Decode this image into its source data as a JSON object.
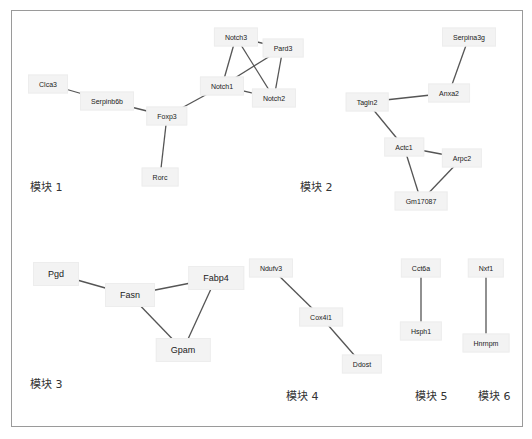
{
  "diagram": {
    "type": "gene-interaction-network",
    "modules": [
      {
        "id": 1,
        "label": "模块 1",
        "pos": [
          30,
          185
        ],
        "nodes": [
          {
            "name": "Clca3",
            "x": 48,
            "y": 84
          },
          {
            "name": "Serpinb6b",
            "x": 107,
            "y": 101
          },
          {
            "name": "Foxp3",
            "x": 167,
            "y": 116
          },
          {
            "name": "Rorc",
            "x": 160,
            "y": 177
          },
          {
            "name": "Notch3",
            "x": 236,
            "y": 37
          },
          {
            "name": "Pard3",
            "x": 283,
            "y": 48
          },
          {
            "name": "Notch1",
            "x": 222,
            "y": 86
          },
          {
            "name": "Notch2",
            "x": 274,
            "y": 98
          }
        ],
        "edges": [
          [
            "Clca3",
            "Serpinb6b"
          ],
          [
            "Serpinb6b",
            "Foxp3"
          ],
          [
            "Foxp3",
            "Rorc"
          ],
          [
            "Foxp3",
            "Notch1"
          ],
          [
            "Notch3",
            "Pard3"
          ],
          [
            "Notch3",
            "Notch1"
          ],
          [
            "Notch3",
            "Notch2"
          ],
          [
            "Pard3",
            "Notch1"
          ],
          [
            "Pard3",
            "Notch2"
          ],
          [
            "Notch1",
            "Notch2"
          ]
        ]
      },
      {
        "id": 2,
        "label": "模块 2",
        "pos": [
          300,
          185
        ],
        "nodes": [
          {
            "name": "Serpina3g",
            "x": 469,
            "y": 37
          },
          {
            "name": "Anxa2",
            "x": 449,
            "y": 93
          },
          {
            "name": "Tagln2",
            "x": 367,
            "y": 102
          },
          {
            "name": "Actc1",
            "x": 404,
            "y": 147
          },
          {
            "name": "Arpc2",
            "x": 462,
            "y": 158
          },
          {
            "name": "Gm17087",
            "x": 421,
            "y": 201
          }
        ],
        "edges": [
          [
            "Serpina3g",
            "Anxa2"
          ],
          [
            "Anxa2",
            "Tagln2"
          ],
          [
            "Tagln2",
            "Actc1"
          ],
          [
            "Actc1",
            "Arpc2"
          ],
          [
            "Actc1",
            "Gm17087"
          ],
          [
            "Arpc2",
            "Gm17087"
          ]
        ]
      },
      {
        "id": 3,
        "label": "模块 3",
        "pos": [
          30,
          382
        ],
        "nodes": [
          {
            "name": "Pgd",
            "x": 56,
            "y": 274
          },
          {
            "name": "Fasn",
            "x": 130,
            "y": 295
          },
          {
            "name": "Fabp4",
            "x": 216,
            "y": 278
          },
          {
            "name": "Gpam",
            "x": 183,
            "y": 350
          }
        ],
        "edges": [
          [
            "Pgd",
            "Fasn"
          ],
          [
            "Fasn",
            "Fabp4"
          ],
          [
            "Fasn",
            "Gpam"
          ],
          [
            "Fabp4",
            "Gpam"
          ]
        ]
      },
      {
        "id": 4,
        "label": "模块 4",
        "pos": [
          286,
          394
        ],
        "nodes": [
          {
            "name": "Ndufv3",
            "x": 271,
            "y": 268
          },
          {
            "name": "Cox4i1",
            "x": 321,
            "y": 317
          },
          {
            "name": "Ddost",
            "x": 362,
            "y": 364
          }
        ],
        "edges": [
          [
            "Ndufv3",
            "Cox4i1"
          ],
          [
            "Cox4i1",
            "Ddost"
          ]
        ]
      },
      {
        "id": 5,
        "label": "模块 5",
        "pos": [
          415,
          394
        ],
        "nodes": [
          {
            "name": "Cct6a",
            "x": 421,
            "y": 268
          },
          {
            "name": "Hsph1",
            "x": 421,
            "y": 331
          }
        ],
        "edges": [
          [
            "Cct6a",
            "Hsph1"
          ]
        ]
      },
      {
        "id": 6,
        "label": "模块 6",
        "pos": [
          478,
          394
        ],
        "nodes": [
          {
            "name": "Nxf1",
            "x": 486,
            "y": 268
          },
          {
            "name": "Hnrnpm",
            "x": 486,
            "y": 343
          }
        ],
        "edges": [
          [
            "Nxf1",
            "Hnrnpm"
          ]
        ]
      }
    ],
    "colors": {
      "node_fill": "#f3f3f3",
      "edge": "#555555",
      "frame": "#9a9a9a",
      "text": "#222222"
    }
  }
}
